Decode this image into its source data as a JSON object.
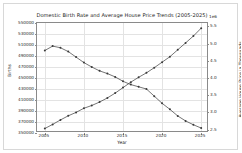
{
  "figure": {
    "offset_label_right": "1e6"
  },
  "chart_data": {
    "type": "line",
    "title": "Domestic Birth Rate and Average House Price Trends (2005-2025)",
    "xlabel": "Year",
    "ylabel": "Births",
    "ylabel_right": "Average House Price in Thousands",
    "grid": true,
    "legend": "none",
    "x": [
      2005,
      2006,
      2007,
      2008,
      2009,
      2010,
      2011,
      2012,
      2013,
      2014,
      2015,
      2016,
      2017,
      2018,
      2019,
      2020,
      2021,
      2022,
      2023,
      2024,
      2025
    ],
    "xlim": [
      2004.0,
      2026.0
    ],
    "xticks": [
      2005,
      2010,
      2015,
      2020,
      2025
    ],
    "xticklabels": [
      "2005",
      "2010",
      "2015",
      "2020",
      "2025"
    ],
    "ylim": [
      350000,
      550000
    ],
    "yticks": [
      350000,
      370000,
      390000,
      410000,
      430000,
      450000,
      470000,
      490000,
      510000,
      530000,
      550000
    ],
    "yticklabels": [
      "350000",
      "370000",
      "390000",
      "410000",
      "430000",
      "450000",
      "470000",
      "490000",
      "510000",
      "530000",
      "550000"
    ],
    "ylim_right": [
      2.4,
      5.6
    ],
    "yticks_right": [
      2.5,
      3.0,
      3.5,
      4.0,
      4.5,
      5.0,
      5.5
    ],
    "yticklabels_right": [
      "2.5",
      "3.0",
      "3.5",
      "4.0",
      "4.5",
      "5.0",
      "5.5"
    ],
    "series": [
      {
        "name": "Births",
        "axis": "left",
        "color": "#3a3a3a",
        "marker": "circle",
        "values": [
          500000,
          508000,
          505000,
          498000,
          488000,
          478000,
          470000,
          463000,
          458000,
          452000,
          444000,
          438000,
          434000,
          430000,
          417000,
          404000,
          393000,
          381000,
          372000,
          365000,
          359000
        ]
      },
      {
        "name": "Average House Price",
        "axis": "right",
        "color": "#3a3a3a",
        "marker": "circle",
        "values": [
          2.53,
          2.65,
          2.78,
          2.9,
          3.0,
          3.12,
          3.2,
          3.3,
          3.42,
          3.56,
          3.72,
          3.88,
          4.02,
          4.15,
          4.3,
          4.46,
          4.62,
          4.82,
          5.02,
          5.22,
          5.45
        ]
      }
    ]
  }
}
